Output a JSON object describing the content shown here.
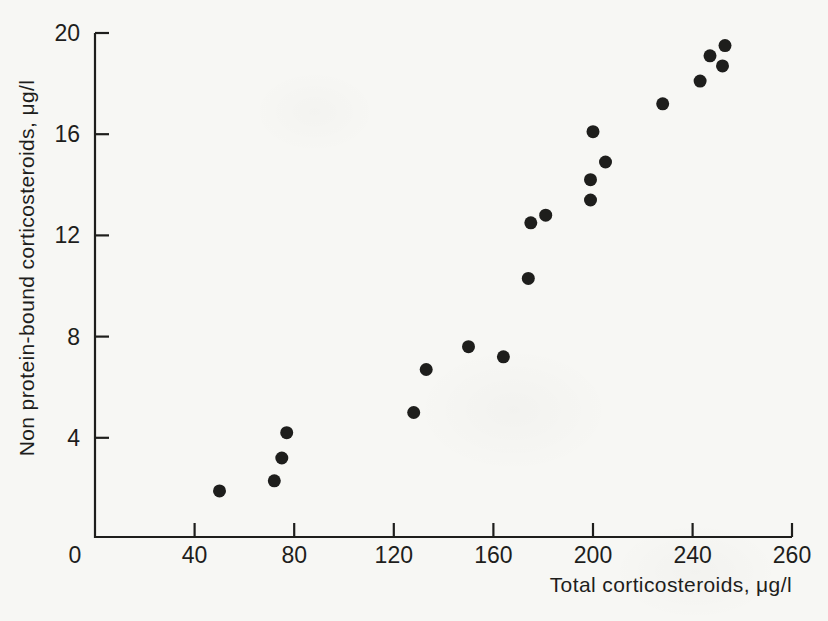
{
  "figure": {
    "background_color": "#f7f7f4",
    "ink_color": "#1e1e1c"
  },
  "chart_data": {
    "type": "scatter",
    "title": "",
    "xlabel": "Total corticosteroids, μg/l",
    "ylabel": "Non protein-bound corticosteroids, μg/l",
    "xlim": [
      0,
      260
    ],
    "ylim": [
      0,
      20
    ],
    "x_ticks": [
      0,
      40,
      80,
      120,
      160,
      200,
      240,
      260
    ],
    "y_ticks": [
      4,
      8,
      12,
      16,
      20
    ],
    "grid": false,
    "legend": false,
    "marker": {
      "shape": "circle",
      "color": "#1e1e1c",
      "radius_px": 6.5
    },
    "points": [
      [
        50,
        1.9
      ],
      [
        72,
        2.3
      ],
      [
        75,
        3.2
      ],
      [
        77,
        4.2
      ],
      [
        128,
        5.0
      ],
      [
        133,
        6.7
      ],
      [
        150,
        7.6
      ],
      [
        164,
        7.2
      ],
      [
        174,
        10.3
      ],
      [
        175,
        12.5
      ],
      [
        181,
        12.8
      ],
      [
        199,
        13.4
      ],
      [
        199,
        14.2
      ],
      [
        200,
        16.1
      ],
      [
        205,
        14.9
      ],
      [
        228,
        17.2
      ],
      [
        243,
        18.1
      ],
      [
        247,
        19.1
      ],
      [
        252,
        18.7
      ],
      [
        253,
        19.5
      ]
    ]
  }
}
